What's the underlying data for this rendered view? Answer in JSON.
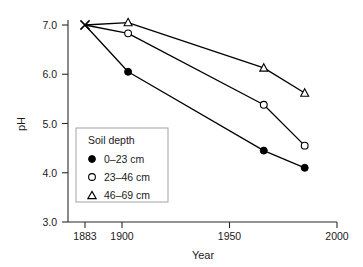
{
  "chart_data": {
    "type": "line",
    "title": "",
    "xlabel": "Year",
    "ylabel": "pH",
    "xlim": [
      1877,
      2000
    ],
    "ylim": [
      3.0,
      7.0
    ],
    "grid": false,
    "legend_position": "center-left-inside",
    "legend_title": "Soil depth",
    "x_ticks": [
      1883,
      1900,
      1950,
      2000
    ],
    "x_tick_labels": [
      "1883",
      "1900",
      "1950",
      "2000"
    ],
    "y_ticks": [
      3.0,
      4.0,
      5.0,
      6.0,
      7.0
    ],
    "y_tick_labels": [
      "3.0",
      "4.0",
      "5.0",
      "6.0",
      "7.0"
    ],
    "origin_marker": {
      "name": "baseline-1883",
      "symbol": "cross-x",
      "x": 1883,
      "y": 7.0
    },
    "series": [
      {
        "name": "0–23 cm",
        "marker": "filled-circle",
        "x": [
          1883,
          1903,
          1966,
          1985
        ],
        "values": [
          7.0,
          6.05,
          4.45,
          4.1
        ]
      },
      {
        "name": "23–46 cm",
        "marker": "open-circle",
        "x": [
          1883,
          1903,
          1966,
          1985
        ],
        "values": [
          7.0,
          6.83,
          5.38,
          4.55
        ]
      },
      {
        "name": "46–69 cm",
        "marker": "open-triangle",
        "x": [
          1883,
          1903,
          1966,
          1985
        ],
        "values": [
          7.0,
          7.05,
          6.13,
          5.62
        ]
      }
    ]
  },
  "legend": {
    "title": "Soil depth",
    "entries": [
      {
        "label": "0–23 cm",
        "marker": "filled-circle"
      },
      {
        "label": "23–46 cm",
        "marker": "open-circle"
      },
      {
        "label": "46–69 cm",
        "marker": "open-triangle"
      }
    ]
  },
  "axes": {
    "x_title": "Year",
    "y_title": "pH",
    "x_tick_labels": [
      "1883",
      "1900",
      "1950",
      "2000"
    ],
    "y_tick_labels": [
      "7.0",
      "6.0",
      "5.0",
      "4.0",
      "3.0"
    ]
  },
  "colors": {
    "line": "#000000",
    "axis": "#2b2b2b",
    "text": "#1a1a1a",
    "legend_border": "#9a9a9a",
    "background": "#ffffff"
  }
}
